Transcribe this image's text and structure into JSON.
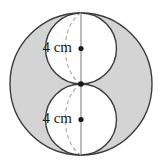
{
  "figure": {
    "background_color": "#ffffff",
    "shaded_region_color": "#d4d4d4",
    "inner_fill_color": "#ffffff",
    "stroke_color": "#3c3c3c",
    "dashed_stroke_color": "#a8a8a8",
    "center_dot_color": "#1a1a1a",
    "outer_circle": {
      "name": "outer-circle",
      "cx": 81,
      "cy": 84,
      "r": 71
    },
    "inner_circles": [
      {
        "name": "upper-inner-circle",
        "cx": 81,
        "cy": 48.5,
        "r": 35.5,
        "label": "4 cm",
        "label_x": 72,
        "label_y": 49,
        "center_dot_x": 81,
        "center_dot_y": 48.5
      },
      {
        "name": "lower-inner-circle",
        "cx": 81,
        "cy": 119.5,
        "r": 35.5,
        "label": "4 cm",
        "label_x": 72,
        "label_y": 120,
        "center_dot_x": 81,
        "center_dot_y": 119.5
      }
    ],
    "vertical_axis": {
      "name": "vertical-diameter-line",
      "x": 81,
      "y1": 13,
      "y2": 155
    },
    "tangent_point": {
      "name": "tangent-point-dot",
      "x": 81,
      "y": 84
    },
    "dashed_arcs": [
      {
        "name": "upper-sphere-dashed-arc",
        "d": "M 81 13 C 60 26 60 71 81 84",
        "dash": "4 3"
      },
      {
        "name": "lower-sphere-dashed-arc",
        "d": "M 81 84 C 60 97 60 142 81 155",
        "dash": "4 3"
      }
    ]
  }
}
